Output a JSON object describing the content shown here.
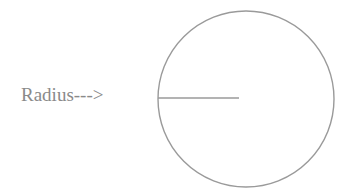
{
  "diagram": {
    "label": "Radius--->",
    "circle": {
      "cx": 246,
      "cy": 99,
      "r": 88,
      "stroke": "#9a9a9a"
    },
    "radius_line": {
      "x1": 158,
      "y1": 98,
      "x2": 239,
      "y2": 98,
      "stroke": "#9a9a9a"
    }
  }
}
